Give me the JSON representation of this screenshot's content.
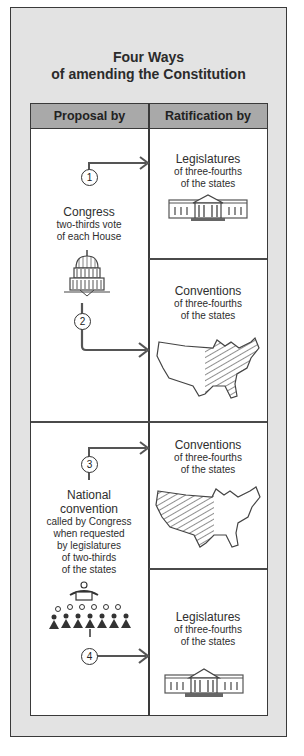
{
  "title": {
    "line1": "Four Ways",
    "line2": "of amending the Constitution"
  },
  "columns": {
    "proposal": "Proposal by",
    "ratification": "Ratification by"
  },
  "proposals": [
    {
      "name": "Congress",
      "lines": [
        "Congress",
        "two-thirds vote",
        "of each House"
      ],
      "icon": "capitol-dome-icon",
      "methods": [
        "1",
        "2"
      ]
    },
    {
      "name": "National convention",
      "lines": [
        "National",
        "convention",
        "called by Congress",
        "when requested",
        "by legislatures",
        "of two-thirds",
        "of the states"
      ],
      "icon": "convention-assembly-icon",
      "methods": [
        "3",
        "4"
      ]
    }
  ],
  "ratifications": [
    {
      "method": "1",
      "heading": "Legislatures",
      "lines": [
        "of three-fourths",
        "of the states"
      ],
      "icon": "statehouse-icon"
    },
    {
      "method": "2",
      "heading": "Conventions",
      "lines": [
        "of three-fourths",
        "of the states"
      ],
      "icon": "us-map-icon"
    },
    {
      "method": "3",
      "heading": "Conventions",
      "lines": [
        "of three-fourths",
        "of the states"
      ],
      "icon": "us-map-icon"
    },
    {
      "method": "4",
      "heading": "Legislatures",
      "lines": [
        "of three-fourths",
        "of the states"
      ],
      "icon": "statehouse-icon"
    }
  ],
  "colors": {
    "frame_bg": "#e3e3e3",
    "header_bg": "#a9a9a9",
    "border": "#3a3a3a",
    "arrow": "#555555"
  }
}
